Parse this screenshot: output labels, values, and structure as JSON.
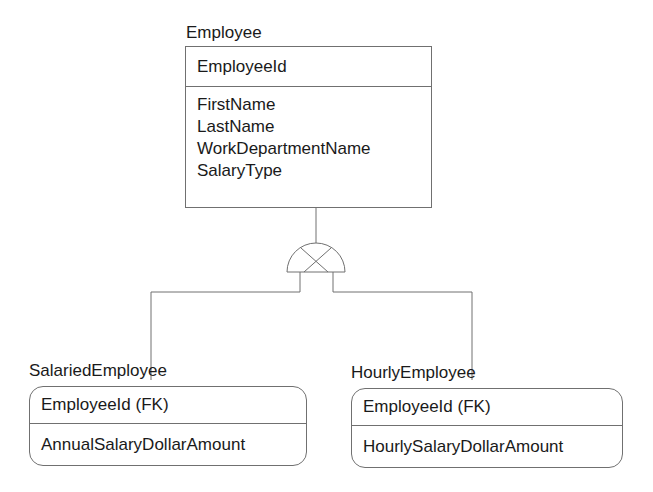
{
  "diagram": {
    "type": "er-subtype-diagram",
    "notation": "IDEF1X exclusive subtype",
    "entities": [
      {
        "name": "Employee",
        "primary_key": [
          "EmployeeId"
        ],
        "attributes": [
          "FirstName",
          "LastName",
          "WorkDepartmentName",
          "SalaryType"
        ]
      },
      {
        "name": "SalariedEmployee",
        "primary_key": [
          "EmployeeId (FK)"
        ],
        "attributes": [
          "AnnualSalaryDollarAmount"
        ]
      },
      {
        "name": "HourlyEmployee",
        "primary_key": [
          "EmployeeId (FK)"
        ],
        "attributes": [
          "HourlySalaryDollarAmount"
        ]
      }
    ],
    "relationships": [
      {
        "parent": "Employee",
        "children": [
          "SalariedEmployee",
          "HourlyEmployee"
        ],
        "symbol": "exclusive-subtype-category"
      }
    ],
    "colors": {
      "line": "#707070",
      "text": "#1a1a1a",
      "background": "#ffffff"
    }
  }
}
